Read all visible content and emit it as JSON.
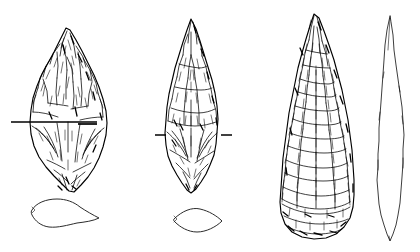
{
  "figure": {
    "background_color": "#ffffff",
    "ink_color": "#000000",
    "width_px": 420,
    "height_px": 252,
    "caption": "",
    "technique": "pen-and-ink archaeological line drawing",
    "specimen_count": 3,
    "view_count": 6
  },
  "specimens": [
    {
      "id": "specimen-1",
      "label": "",
      "view": "dorsal face",
      "form": "leaf-shaped biface, pointed tip, tapering base",
      "flaking": "invasive bifacial flake scars with hatched ridges",
      "bbox": [
        28,
        28,
        107,
        192
      ],
      "has_section_line": true,
      "section_line": {
        "type": "full-width section indicator",
        "y": 122,
        "x_start": 11,
        "x_end": 97
      },
      "cross_section": {
        "id": "xsection-1",
        "shape": "irregular plano-convex lenticular",
        "bbox": [
          29,
          198,
          99,
          228
        ]
      }
    },
    {
      "id": "specimen-2",
      "label": "",
      "view": "dorsal face",
      "form": "narrow elongated biface, acute tip, rounded base",
      "flaking": "parallel oblique flake scars with hatched ridges",
      "bbox": [
        165,
        19,
        218,
        193
      ],
      "has_section_line": true,
      "section_line": {
        "type": "paired short tick marks",
        "y": 135,
        "left_tick": [
          155,
          166
        ],
        "right_tick": [
          221,
          232
        ]
      },
      "cross_section": {
        "id": "xsection-2",
        "shape": "symmetrical biconvex lenticular",
        "bbox": [
          172,
          208,
          222,
          232
        ]
      }
    },
    {
      "id": "specimen-3",
      "label": "",
      "view": "dorsal face",
      "form": "large elongated biface, acute tip, broad rounded base",
      "flaking": "dense covering flake scars, heavy basal retouch",
      "bbox": [
        280,
        14,
        356,
        240
      ],
      "has_section_line": false,
      "section_line": null,
      "cross_section": null,
      "profile_view": {
        "id": "profile-3",
        "shape": "narrow lanceolate side profile outline",
        "bbox": [
          377,
          16,
          404,
          241
        ]
      }
    }
  ],
  "annotations": {
    "scale_bar": "",
    "figure_number": "",
    "notes": ""
  }
}
